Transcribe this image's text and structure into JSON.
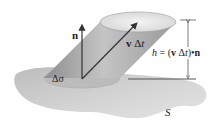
{
  "figure": {
    "labels": {
      "normal": "n",
      "velocity_prefix": "v",
      "velocity_delta": " Δ",
      "velocity_t": "t",
      "area": "Δσ",
      "height_h": "h",
      "height_eq": " = (",
      "height_v": "v",
      "height_dt": " Δ",
      "height_t": "t",
      "height_dot": ")•",
      "height_n": "n",
      "surface": "S"
    },
    "colors": {
      "surface": "#cfcfcf",
      "cylinder_side": "#a9a9a9",
      "cylinder_top": "#e6e6e6",
      "base_ellipse": "#bdbdbd",
      "arrow": "#333333"
    }
  }
}
